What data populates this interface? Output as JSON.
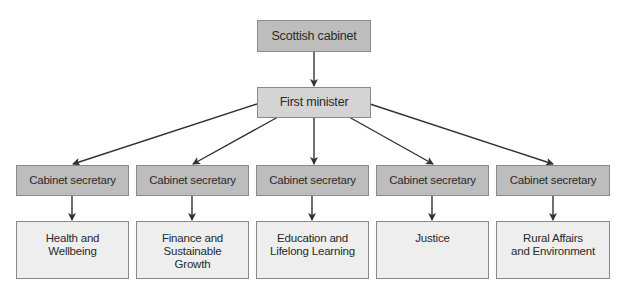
{
  "diagram": {
    "type": "org-chart",
    "root": {
      "label": "Scottish cabinet"
    },
    "level2": {
      "label": "First minister"
    },
    "secretaries": [
      {
        "label": "Cabinet secretary",
        "department": "Health and\nWellbeing"
      },
      {
        "label": "Cabinet secretary",
        "department": "Finance and\nSustainable\nGrowth"
      },
      {
        "label": "Cabinet secretary",
        "department": "Education and\nLifelong Learning"
      },
      {
        "label": "Cabinet secretary",
        "department": "Justice"
      },
      {
        "label": "Cabinet secretary",
        "department": "Rural Affairs\nand Environment"
      }
    ],
    "colors": {
      "root": "#bdbdbd",
      "level2": "#d4d4d4",
      "secretary": "#bdbdbd",
      "department": "#eeeeee",
      "line": "#333333"
    }
  }
}
